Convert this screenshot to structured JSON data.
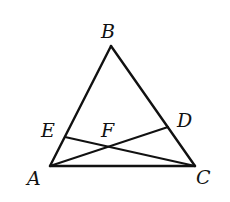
{
  "figure": {
    "type": "triangle with two cevians",
    "points": {
      "A": {
        "label": "A",
        "x": 50,
        "y": 166,
        "label_x": 27,
        "label_y": 185
      },
      "B": {
        "label": "B",
        "x": 111,
        "y": 46,
        "label_x": 101,
        "label_y": 38
      },
      "C": {
        "label": "C",
        "x": 195,
        "y": 166,
        "label_x": 196,
        "label_y": 184
      },
      "D": {
        "label": "D",
        "x": 168,
        "y": 127,
        "label_x": 177,
        "label_y": 127
      },
      "E": {
        "label": "E",
        "x": 65,
        "y": 137,
        "label_x": 41,
        "label_y": 137
      },
      "F": {
        "label": "F",
        "x": 108,
        "y": 147,
        "label_x": 101,
        "label_y": 137
      }
    },
    "segments": [
      {
        "name": "AB",
        "from": "A",
        "to": "B"
      },
      {
        "name": "BC",
        "from": "B",
        "to": "C"
      },
      {
        "name": "AC",
        "from": "A",
        "to": "C"
      },
      {
        "name": "AD",
        "from": "A",
        "to": "D"
      },
      {
        "name": "CE",
        "from": "C",
        "to": "E"
      }
    ],
    "intersection": {
      "point": "F",
      "of": [
        "AD",
        "CE"
      ]
    },
    "colors": {
      "stroke": "#111111",
      "background": "#ffffff"
    }
  }
}
